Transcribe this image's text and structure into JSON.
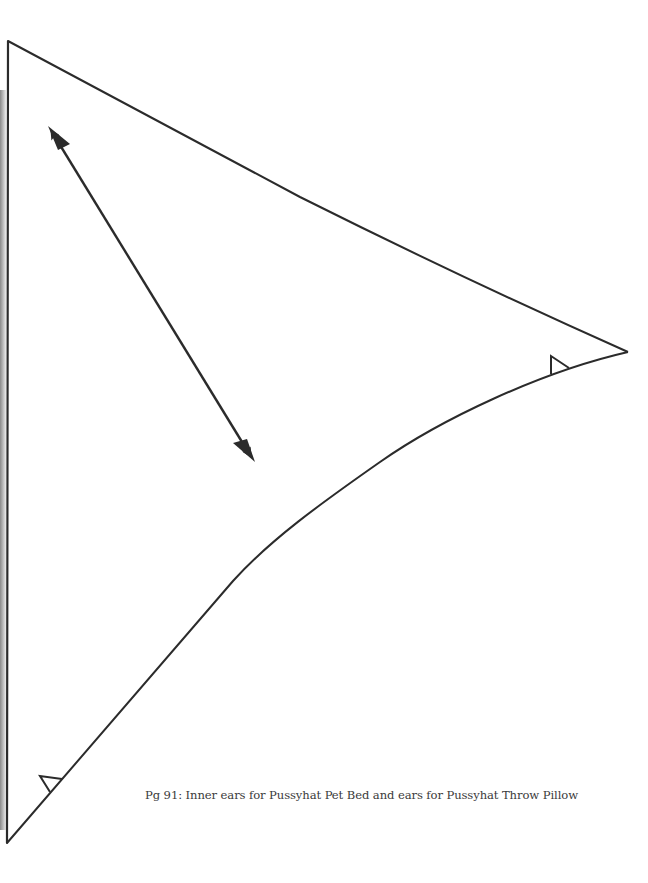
{
  "document": {
    "type": "sewing-pattern-page",
    "caption": "Pg 91: Inner ears for Pussyhat Pet Bed and ears for Pussyhat Throw Pillow",
    "pattern_piece": {
      "shape": "ear-triangle",
      "marks": [
        "grainline-arrow",
        "notch-right",
        "notch-bottom-left"
      ]
    },
    "colors": {
      "line": "#2b2b2b",
      "text": "#3a3a3a",
      "background": "#ffffff"
    }
  }
}
